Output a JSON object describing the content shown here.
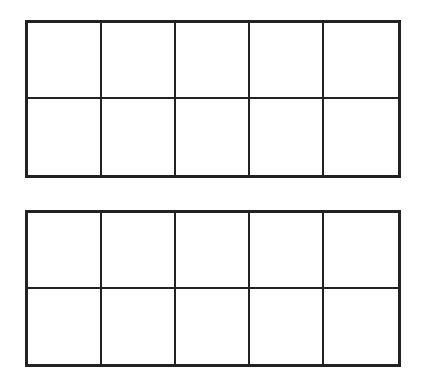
{
  "figure": {
    "frames": [
      {
        "id": "top",
        "rows": 2,
        "columns": 5,
        "filled_cells": []
      },
      {
        "id": "bottom",
        "rows": 2,
        "columns": 5,
        "filled_cells": []
      }
    ],
    "line_color": "#222222",
    "background": "#ffffff"
  }
}
